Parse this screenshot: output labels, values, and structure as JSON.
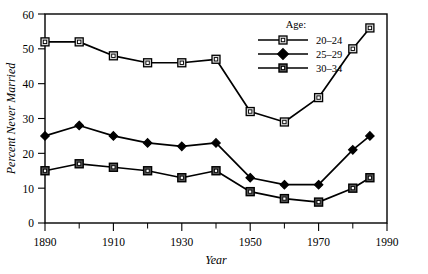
{
  "chart_data": {
    "type": "line",
    "title": "",
    "xlabel": "Year",
    "ylabel": "Percent Never Married",
    "xlim": [
      1890,
      1990
    ],
    "ylim": [
      0,
      60
    ],
    "grid": false,
    "legend_position": "top-right",
    "legend_title": "Age:",
    "x_ticks": [
      1890,
      1910,
      1930,
      1950,
      1970,
      1990
    ],
    "x_ticks_minor": [
      1900,
      1920,
      1940,
      1960,
      1980
    ],
    "y_ticks": [
      0,
      10,
      20,
      30,
      40,
      50,
      60
    ],
    "x": [
      1890,
      1900,
      1910,
      1920,
      1930,
      1940,
      1950,
      1960,
      1970,
      1980,
      1985
    ],
    "series": [
      {
        "name": "20–24",
        "marker": "open-square",
        "values": [
          52,
          52,
          48,
          46,
          46,
          47,
          32,
          29,
          36,
          50,
          56
        ]
      },
      {
        "name": "25–29",
        "marker": "filled-diamond",
        "values": [
          25,
          28,
          25,
          23,
          22,
          23,
          13,
          11,
          11,
          21,
          25
        ]
      },
      {
        "name": "30–34",
        "marker": "filled-square",
        "values": [
          15,
          17,
          16,
          15,
          13,
          15,
          9,
          7,
          6,
          10,
          13
        ]
      }
    ]
  },
  "axes": {
    "x_tick_labels": [
      "1890",
      "1910",
      "1930",
      "1950",
      "1970",
      "1990"
    ],
    "y_tick_labels": [
      "0",
      "10",
      "20",
      "30",
      "40",
      "50",
      "60"
    ],
    "x_axis_label": "Year",
    "y_axis_label": "Percent Never Married"
  },
  "legend": {
    "heading": "Age:",
    "entries": [
      {
        "label": "20–24"
      },
      {
        "label": "25–29"
      },
      {
        "label": "30–34"
      }
    ]
  },
  "colors": {
    "ink": "#000000",
    "background": "#ffffff",
    "marker_fill_open": "#d8d8d8",
    "marker_fill_solid": "#000000"
  }
}
